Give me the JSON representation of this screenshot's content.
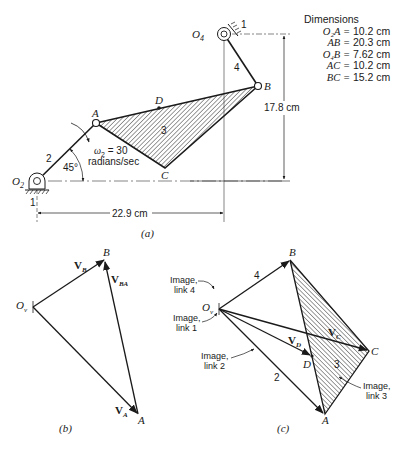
{
  "figure_a": {
    "caption": "(a)",
    "points": {
      "O2": "O",
      "O2_sub": "2",
      "O4": "O",
      "O4_sub": "4",
      "A": "A",
      "B": "B",
      "C": "C",
      "D": "D"
    },
    "link_labels": {
      "ground": "1",
      "ground2": "1",
      "crank": "2",
      "coupler": "3",
      "rocker": "4"
    },
    "angle": "45°",
    "omega_line1_sym": "ω",
    "omega_line1_sub": "2",
    "omega_line1_val": " = 30",
    "omega_line2": "radians/sec",
    "dim_horizontal": "22.9 cm",
    "dim_vertical": "17.8 cm",
    "dimensions": {
      "title": "Dimensions",
      "rows": [
        {
          "key": "O₂A =",
          "value": "10.2 cm"
        },
        {
          "key": "AB =",
          "value": "20.3 cm"
        },
        {
          "key": "O₄B =",
          "value": "7.62 cm"
        },
        {
          "key": "AC =",
          "value": "10.2 cm"
        },
        {
          "key": "BC =",
          "value": "15.2 cm"
        }
      ]
    }
  },
  "figure_b": {
    "caption": "(b)",
    "origin": "O",
    "origin_sub": "v",
    "points": {
      "A": "A",
      "B": "B"
    },
    "vectors": {
      "VB": "V",
      "VB_sub": "B",
      "VBA": "V",
      "VBA_sub": "BA",
      "VA": "V",
      "VA_sub": "A"
    }
  },
  "figure_c": {
    "caption": "(c)",
    "origin": "O",
    "origin_sub": "v",
    "points": {
      "A": "A",
      "B": "B",
      "C": "C",
      "D": "D"
    },
    "link_labels": {
      "l2": "2",
      "l3": "3",
      "l4": "4"
    },
    "vectors": {
      "VC": "V",
      "VC_sub": "C",
      "VD": "V",
      "VD_sub": "D"
    },
    "images": {
      "link4": [
        "Image,",
        "link 4"
      ],
      "link1": [
        "Image,",
        "link 1"
      ],
      "link2": [
        "Image,",
        "link 2"
      ],
      "link3": [
        "Image,",
        "link 3"
      ]
    }
  }
}
